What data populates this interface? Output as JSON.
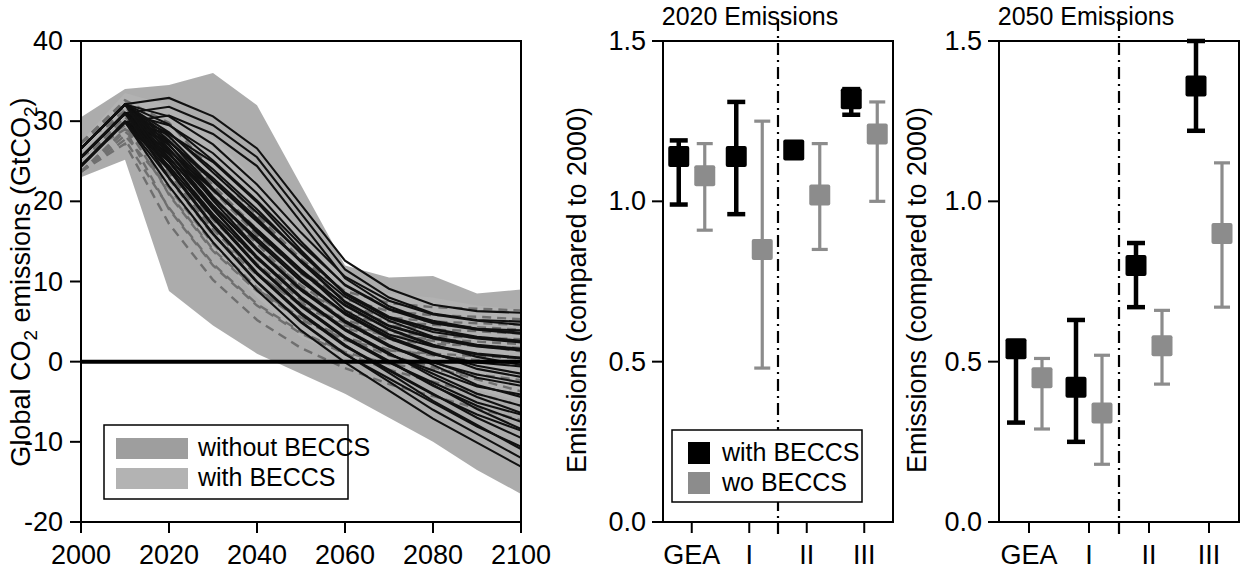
{
  "figure": {
    "background": "#ffffff",
    "colors": {
      "black": "#000000",
      "gray_marker": "#8c8c8c",
      "band_without_beccs": "#9e9e9e",
      "band_with_beccs": "#b3b3b3",
      "dashed_trajectory": "#6f6f6f"
    }
  },
  "panels": {
    "left": {
      "title": "",
      "ylabel": "Global CO2 emissions (GtCO2)",
      "ylabel_parts": {
        "pre": "Global CO",
        "sub1": "2",
        "mid": " emissions (GtCO",
        "sub2": "2",
        "post": ")"
      },
      "xlabel": "",
      "legend": {
        "items": [
          {
            "label": "without BECCS",
            "color": "#9e9e9e",
            "swatch": "band"
          },
          {
            "label": "with BECCS",
            "color": "#b3b3b3",
            "swatch": "band"
          }
        ]
      }
    },
    "mid": {
      "title": "2020 Emissions",
      "ylabel": "Emissions (compared to 2000)",
      "legend": {
        "items": [
          {
            "label": "with BECCS",
            "color": "#000000",
            "swatch": "square"
          },
          {
            "label": "wo BECCS",
            "color": "#8c8c8c",
            "swatch": "square"
          }
        ]
      }
    },
    "right": {
      "title": "2050 Emissions",
      "ylabel": "Emissions (compared to 2000)",
      "legend": {
        "items": []
      }
    }
  },
  "chart_data": [
    {
      "id": "left",
      "type": "area",
      "title": "",
      "xlabel": "",
      "ylabel": "Global CO2 emissions (GtCO2)",
      "xlim": [
        2000,
        2100
      ],
      "ylim": [
        -20,
        40
      ],
      "xticks": [
        2000,
        2020,
        2040,
        2060,
        2080,
        2100
      ],
      "xticklabels": [
        "2000",
        "2020",
        "2040",
        "2060",
        "2080",
        "2100"
      ],
      "yticks": [
        -20,
        -10,
        0,
        10,
        20,
        30,
        40
      ],
      "yticklabels": [
        "-20",
        "-10",
        "0",
        "10",
        "20",
        "30",
        "40"
      ],
      "grid": false,
      "zero_line": 0,
      "x": [
        2000,
        2010,
        2020,
        2030,
        2040,
        2050,
        2060,
        2070,
        2080,
        2090,
        2100
      ],
      "bands": [
        {
          "name": "without BECCS",
          "color": "#9e9e9e",
          "upper": [
            30.5,
            34.0,
            34.5,
            36.0,
            32.0,
            22.0,
            12.0,
            10.5,
            10.7,
            8.5,
            9.0
          ],
          "lower": [
            23.0,
            25.2,
            8.8,
            4.5,
            1.0,
            -1.5,
            -4.0,
            -7.0,
            -10.0,
            -13.5,
            -16.5
          ]
        },
        {
          "name": "with BECCS",
          "color": "#b3b3b3",
          "upper": [
            27.5,
            33.5,
            32.0,
            28.0,
            22.5,
            16.0,
            10.5,
            8.5,
            8.0,
            7.0,
            6.5
          ],
          "lower": [
            25.5,
            30.5,
            22.0,
            14.0,
            8.0,
            3.0,
            0.5,
            -1.0,
            -2.5,
            -3.5,
            -5.0
          ]
        }
      ],
      "series_solid": [
        {
          "name": "scenario envelope upper",
          "values": [
            25.5,
            31.0,
            31.8,
            29.5,
            25.5,
            18.5,
            11.5,
            8.0,
            6.0,
            5.2,
            5.0
          ]
        },
        {
          "name": "scenario 1",
          "values": [
            25.5,
            31.0,
            29.5,
            26.0,
            21.0,
            15.0,
            9.5,
            6.5,
            4.8,
            4.0,
            3.5
          ]
        },
        {
          "name": "scenario 2",
          "values": [
            25.5,
            31.0,
            28.5,
            24.0,
            19.0,
            13.5,
            8.5,
            5.5,
            4.0,
            3.0,
            2.5
          ]
        },
        {
          "name": "scenario 3",
          "values": [
            25.5,
            31.0,
            27.5,
            22.5,
            17.5,
            12.5,
            7.5,
            4.5,
            3.0,
            2.0,
            1.5
          ]
        },
        {
          "name": "scenario 4",
          "values": [
            25.5,
            31.0,
            27.0,
            21.5,
            16.5,
            11.5,
            7.0,
            4.0,
            2.0,
            1.0,
            0.5
          ]
        },
        {
          "name": "scenario 5",
          "values": [
            25.5,
            31.0,
            26.5,
            20.5,
            15.0,
            10.0,
            6.0,
            3.0,
            1.0,
            -0.5,
            -1.5
          ]
        },
        {
          "name": "scenario 6",
          "values": [
            25.5,
            31.0,
            26.0,
            19.5,
            14.0,
            9.0,
            5.0,
            2.0,
            0.0,
            -2.0,
            -3.0
          ]
        },
        {
          "name": "scenario 7",
          "values": [
            25.5,
            31.0,
            25.5,
            19.0,
            13.0,
            8.0,
            4.0,
            1.0,
            -1.5,
            -4.0,
            -5.5
          ]
        },
        {
          "name": "scenario 8",
          "values": [
            25.5,
            31.0,
            25.0,
            18.0,
            12.0,
            7.0,
            3.0,
            0.0,
            -3.0,
            -5.5,
            -7.5
          ]
        },
        {
          "name": "scenario 9",
          "values": [
            25.5,
            31.0,
            24.0,
            17.0,
            11.0,
            6.0,
            2.0,
            -1.0,
            -4.0,
            -7.0,
            -9.5
          ]
        },
        {
          "name": "scenario 10",
          "values": [
            25.5,
            31.0,
            23.0,
            16.0,
            10.0,
            5.0,
            1.0,
            -2.5,
            -6.0,
            -9.0,
            -12.0
          ]
        }
      ],
      "series_dashed": [
        {
          "name": "with BECCS scenario A",
          "values": [
            25.5,
            30.8,
            28.0,
            22.0,
            16.5,
            11.0,
            7.0,
            5.5,
            5.0,
            4.8,
            4.6
          ]
        },
        {
          "name": "with BECCS scenario B",
          "values": [
            25.5,
            30.5,
            26.0,
            19.5,
            14.0,
            9.5,
            6.0,
            4.5,
            4.0,
            3.8,
            3.5
          ]
        },
        {
          "name": "with BECCS scenario C",
          "values": [
            25.5,
            30.0,
            23.5,
            16.5,
            11.0,
            7.0,
            4.5,
            3.2,
            2.8,
            2.5,
            2.2
          ]
        },
        {
          "name": "with BECCS scenario D",
          "values": [
            25.5,
            29.5,
            21.0,
            14.0,
            9.0,
            5.5,
            3.0,
            1.5,
            0.8,
            0.2,
            -0.5
          ]
        },
        {
          "name": "with BECCS scenario E",
          "values": [
            25.5,
            29.0,
            19.0,
            12.0,
            7.0,
            3.5,
            1.0,
            -1.0,
            -2.5,
            -4.0,
            -5.5
          ]
        }
      ]
    },
    {
      "id": "mid",
      "type": "scatter",
      "title": "2020 Emissions",
      "xlabel": "",
      "ylabel": "Emissions (compared to 2000)",
      "ylim": [
        0.0,
        1.5
      ],
      "yticks": [
        0.0,
        0.5,
        1.0,
        1.5
      ],
      "yticklabels": [
        "0.0",
        "0.5",
        "1.0",
        "1.5"
      ],
      "categories": [
        "GEA",
        "I",
        "II",
        "III"
      ],
      "divider_after_category": "I",
      "grid": false,
      "series": [
        {
          "name": "with BECCS",
          "color": "#000000",
          "values": [
            1.14,
            1.14,
            1.16,
            1.32
          ],
          "err_low": [
            0.99,
            0.96,
            1.16,
            1.27
          ],
          "err_high": [
            1.19,
            1.31,
            1.16,
            1.35
          ]
        },
        {
          "name": "wo BECCS",
          "color": "#8c8c8c",
          "values": [
            1.08,
            0.85,
            1.02,
            1.21
          ],
          "err_low": [
            0.91,
            0.48,
            0.85,
            1.0
          ],
          "err_high": [
            1.18,
            1.25,
            1.18,
            1.31
          ]
        }
      ]
    },
    {
      "id": "right",
      "type": "scatter",
      "title": "2050 Emissions",
      "xlabel": "",
      "ylabel": "Emissions (compared to 2000)",
      "ylim": [
        0.0,
        1.5
      ],
      "yticks": [
        0.0,
        0.5,
        1.0,
        1.5
      ],
      "yticklabels": [
        "0.0",
        "0.5",
        "1.0",
        "1.5"
      ],
      "categories": [
        "GEA",
        "I",
        "II",
        "III"
      ],
      "divider_after_category": "I",
      "grid": false,
      "series": [
        {
          "name": "with BECCS",
          "color": "#000000",
          "values": [
            0.54,
            0.42,
            0.8,
            1.36
          ],
          "err_low": [
            0.31,
            0.25,
            0.67,
            1.22
          ],
          "err_high": [
            0.55,
            0.63,
            0.87,
            1.5
          ]
        },
        {
          "name": "wo BECCS",
          "color": "#8c8c8c",
          "values": [
            0.45,
            0.34,
            0.55,
            0.9
          ],
          "err_low": [
            0.29,
            0.18,
            0.43,
            0.67
          ],
          "err_high": [
            0.51,
            0.52,
            0.66,
            1.12
          ]
        }
      ]
    }
  ]
}
